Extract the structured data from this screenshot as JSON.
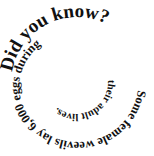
{
  "spiral": {
    "headline": "Did you know?",
    "fact_part1": "Some female weevils lay 6,000 eggs during",
    "fact_part2": "their adult lives.",
    "full_text": "Did you know? Some female weevils lay 6,000 eggs during their adult lives."
  },
  "colors": {
    "text": "#111111",
    "background": "#ffffff"
  }
}
